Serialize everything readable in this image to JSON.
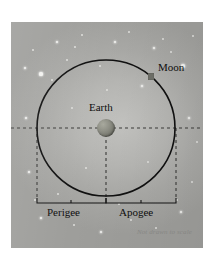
{
  "figure": {
    "footnote": "Not drawn to scale",
    "background_color": "#b4b4b1",
    "stroke_color": "#101010"
  },
  "labels": {
    "earth": "Earth",
    "moon": "Moon",
    "perigee": "Perigee",
    "apogee": "Apogee"
  },
  "chart_data": {
    "type": "diagram",
    "annotations": [
      {
        "name": "Earth",
        "role": "central body",
        "position": [
          106,
          128
        ]
      },
      {
        "name": "Moon",
        "role": "orbiting body",
        "position": [
          151,
          76
        ]
      },
      {
        "name": "Perigee",
        "role": "closest approach span",
        "span": [
          37,
          106
        ]
      },
      {
        "name": "Apogee",
        "role": "farthest distance span",
        "span": [
          106,
          176
        ]
      }
    ],
    "orbit": {
      "shape": "ellipse",
      "center": [
        106,
        128
      ],
      "radius_x": 69,
      "radius_y": 68,
      "stroke": "#101010"
    },
    "reference_lines": [
      {
        "type": "horizontal-dashed",
        "y": 128,
        "from_x": 11,
        "to_x": 203
      },
      {
        "type": "vertical-dashed",
        "x": 37,
        "from_y": 128,
        "to_y": 198
      },
      {
        "type": "vertical-dashed",
        "x": 106,
        "from_y": 128,
        "to_y": 198
      },
      {
        "type": "vertical-dashed",
        "x": 176,
        "from_y": 128,
        "to_y": 198
      }
    ],
    "legend": [],
    "grid": false,
    "footnote": "Not drawn to scale"
  },
  "stars": [
    {
      "x": 22,
      "y": 28,
      "r": 1.0,
      "kind": "dim"
    },
    {
      "x": 46,
      "y": 20,
      "r": 1.4,
      "kind": "big"
    },
    {
      "x": 71,
      "y": 13,
      "r": 1.0,
      "kind": "dim"
    },
    {
      "x": 14,
      "y": 46,
      "r": 1.2,
      "kind": "big"
    },
    {
      "x": 30,
      "y": 52,
      "r": 1.6,
      "kind": "big"
    },
    {
      "x": 41,
      "y": 58,
      "r": 1.0,
      "kind": "dim"
    },
    {
      "x": 56,
      "y": 38,
      "r": 1.1,
      "kind": "dim"
    },
    {
      "x": 64,
      "y": 25,
      "r": 0.9,
      "kind": "dim"
    },
    {
      "x": 89,
      "y": 44,
      "r": 1.0,
      "kind": "dim"
    },
    {
      "x": 104,
      "y": 20,
      "r": 1.3,
      "kind": "big"
    },
    {
      "x": 118,
      "y": 10,
      "r": 0.9,
      "kind": "dim"
    },
    {
      "x": 131,
      "y": 64,
      "r": 1.2,
      "kind": "big"
    },
    {
      "x": 143,
      "y": 26,
      "r": 1.4,
      "kind": "big"
    },
    {
      "x": 152,
      "y": 17,
      "r": 1.0,
      "kind": "dim"
    },
    {
      "x": 160,
      "y": 30,
      "r": 1.1,
      "kind": "dim"
    },
    {
      "x": 172,
      "y": 44,
      "r": 1.8,
      "kind": "big"
    },
    {
      "x": 182,
      "y": 14,
      "r": 1.0,
      "kind": "dim"
    },
    {
      "x": 96,
      "y": 68,
      "r": 0.9,
      "kind": "dim"
    },
    {
      "x": 61,
      "y": 86,
      "r": 1.1,
      "kind": "dim"
    },
    {
      "x": 15,
      "y": 96,
      "r": 1.2,
      "kind": "big"
    },
    {
      "x": 27,
      "y": 120,
      "r": 1.0,
      "kind": "dim"
    },
    {
      "x": 18,
      "y": 150,
      "r": 1.3,
      "kind": "big"
    },
    {
      "x": 24,
      "y": 178,
      "r": 1.0,
      "kind": "dim"
    },
    {
      "x": 47,
      "y": 172,
      "r": 1.1,
      "kind": "dim"
    },
    {
      "x": 30,
      "y": 196,
      "r": 1.4,
      "kind": "big"
    },
    {
      "x": 63,
      "y": 203,
      "r": 1.0,
      "kind": "dim"
    },
    {
      "x": 90,
      "y": 210,
      "r": 1.2,
      "kind": "big"
    },
    {
      "x": 120,
      "y": 198,
      "r": 0.9,
      "kind": "dim"
    },
    {
      "x": 145,
      "y": 206,
      "r": 1.1,
      "kind": "dim"
    },
    {
      "x": 170,
      "y": 190,
      "r": 1.3,
      "kind": "big"
    },
    {
      "x": 181,
      "y": 160,
      "r": 1.1,
      "kind": "dim"
    },
    {
      "x": 186,
      "y": 120,
      "r": 1.0,
      "kind": "dim"
    },
    {
      "x": 178,
      "y": 96,
      "r": 1.2,
      "kind": "big"
    },
    {
      "x": 166,
      "y": 178,
      "r": 0.9,
      "kind": "dim"
    },
    {
      "x": 108,
      "y": 182,
      "r": 0.9,
      "kind": "dim"
    },
    {
      "x": 75,
      "y": 146,
      "r": 0.9,
      "kind": "dim"
    },
    {
      "x": 137,
      "y": 140,
      "r": 0.9,
      "kind": "dim"
    }
  ]
}
